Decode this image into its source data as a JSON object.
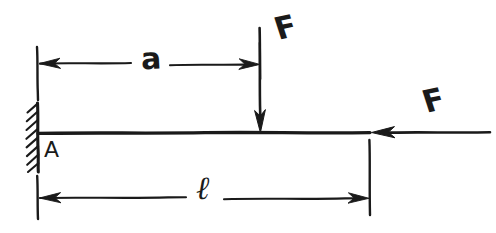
{
  "diagram": {
    "kind": "cantilever-beam-free-body-diagram",
    "style": "hand-drawn sketch, black ink on white paper",
    "background_color": "#ffffff",
    "ink_color": "#1a1a1a",
    "labels": {
      "support_point": "A",
      "distance_a": "a",
      "length_l": "ℓ",
      "force_vertical": "F",
      "force_horizontal": "F"
    },
    "elements": [
      {
        "name": "fixed-support-wall",
        "description": "hatched vertical wall at left end"
      },
      {
        "name": "beam",
        "description": "horizontal beam line from support to free end"
      },
      {
        "name": "vertical-force-arrow",
        "description": "downward arrow applied at distance a from support"
      },
      {
        "name": "horizontal-force-arrow",
        "description": "leftward arrow applied at the free end"
      },
      {
        "name": "dimension-a",
        "description": "double-headed dimension line from support to vertical force"
      },
      {
        "name": "dimension-l",
        "description": "double-headed dimension line spanning full beam length"
      }
    ]
  },
  "geometry": {
    "beam_y": 133,
    "beam_x_start": 38,
    "beam_x_end": 370,
    "force_vertical_x": 260,
    "dim_a_y": 63,
    "dim_l_y": 197
  }
}
